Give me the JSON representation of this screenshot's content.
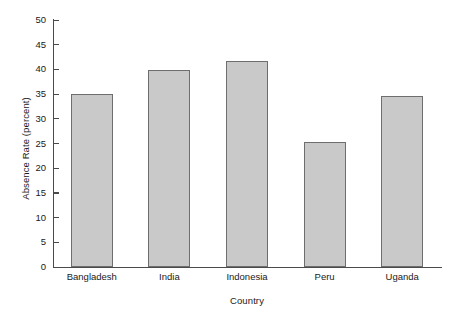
{
  "chart_data": {
    "type": "bar",
    "title": "",
    "xlabel": "Country",
    "ylabel": "Absence Rate (percent)",
    "categories": [
      "Bangladesh",
      "India",
      "Indonesia",
      "Peru",
      "Uganda"
    ],
    "values": [
      35.0,
      39.9,
      41.8,
      25.4,
      34.7
    ],
    "ylim": [
      0,
      50
    ],
    "yticks": [
      0,
      5,
      10,
      15,
      20,
      25,
      30,
      35,
      40,
      45,
      50
    ],
    "ytick_labels": [
      "0",
      "5",
      "10",
      "15",
      "20",
      "25",
      "30",
      "35",
      "40",
      "45",
      "50"
    ],
    "grid": false,
    "legend": null,
    "bar_color": "#c9c9c9",
    "bar_edge_color": "#6e6e6e",
    "axis_color": "#4a4a4a",
    "background_color": "#ffffff"
  }
}
